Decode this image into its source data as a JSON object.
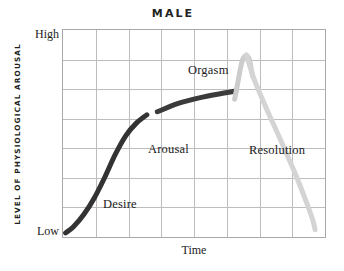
{
  "chart_data": {
    "type": "line",
    "title": "MALE",
    "xlabel": "Time",
    "ylabel": "LEVEL OF PHYSIOLOGICAL AROUSAL",
    "ytick_labels": [
      "High",
      "Low"
    ],
    "ylim": [
      "Low",
      "High"
    ],
    "grid": true,
    "grid_columns": 8,
    "grid_rows": 7,
    "legend": "none",
    "annotations": [
      {
        "text": "Desire",
        "phase": "desire"
      },
      {
        "text": "Arousal",
        "phase": "arousal"
      },
      {
        "text": "Orgasm",
        "phase": "orgasm"
      },
      {
        "text": "Resolution",
        "phase": "resolution"
      }
    ],
    "series": [
      {
        "name": "Desire",
        "color": "#333333",
        "stroke_width": 5,
        "points": [
          [
            0.01,
            0.02
          ],
          [
            0.04,
            0.05
          ],
          [
            0.08,
            0.11
          ],
          [
            0.12,
            0.19
          ],
          [
            0.16,
            0.29
          ],
          [
            0.2,
            0.4
          ],
          [
            0.24,
            0.49
          ],
          [
            0.28,
            0.55
          ],
          [
            0.32,
            0.59
          ]
        ]
      },
      {
        "name": "Arousal",
        "color": "#3b3b3b",
        "stroke_width": 5,
        "points": [
          [
            0.36,
            0.605
          ],
          [
            0.44,
            0.645
          ],
          [
            0.52,
            0.672
          ],
          [
            0.6,
            0.692
          ],
          [
            0.66,
            0.705
          ]
        ]
      },
      {
        "name": "Orgasm",
        "color": "#cccccc",
        "stroke_width": 5,
        "points": [
          [
            0.655,
            0.665
          ],
          [
            0.665,
            0.73
          ],
          [
            0.675,
            0.8
          ],
          [
            0.685,
            0.855
          ],
          [
            0.697,
            0.875
          ],
          [
            0.71,
            0.862
          ],
          [
            0.718,
            0.815
          ],
          [
            0.724,
            0.775
          ]
        ]
      },
      {
        "name": "Resolution",
        "color": "#d4d4d4",
        "stroke_width": 5,
        "points": [
          [
            0.7,
            0.88
          ],
          [
            0.73,
            0.76
          ],
          [
            0.775,
            0.625
          ],
          [
            0.83,
            0.47
          ],
          [
            0.885,
            0.31
          ],
          [
            0.93,
            0.165
          ],
          [
            0.955,
            0.075
          ],
          [
            0.962,
            0.035
          ]
        ]
      }
    ]
  },
  "chart": {
    "title": "MALE",
    "ylabel": "LEVEL OF PHYSIOLOGICAL AROUSAL",
    "xlabel": "Time",
    "tick_high": "High",
    "tick_low": "Low",
    "labels": {
      "desire": "Desire",
      "arousal": "Arousal",
      "orgasm": "Orgasm",
      "resolution": "Resolution"
    }
  }
}
